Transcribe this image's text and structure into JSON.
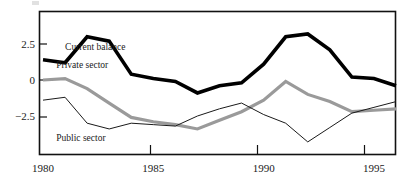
{
  "chart_data": {
    "type": "line",
    "title": "",
    "subtitle": "",
    "xlabel": "",
    "ylabel": "",
    "x": [
      1980,
      1981,
      1982,
      1983,
      1984,
      1985,
      1986,
      1987,
      1988,
      1989,
      1990,
      1991,
      1992,
      1993,
      1994,
      1995,
      1996
    ],
    "xlim": [
      1980,
      1996
    ],
    "ylim": [
      -5.0,
      4.1
    ],
    "x_tick_values": [
      1980,
      1985,
      1990,
      1995
    ],
    "x_tick_labels": [
      "1980",
      "1985",
      "1990",
      "1995"
    ],
    "y_tick_values": [
      2.5,
      0,
      -2.5
    ],
    "y_tick_labels": [
      "2.5",
      "0",
      "−2.5"
    ],
    "grid": false,
    "legend": "inline-annotations",
    "series": [
      {
        "name": "Current balance",
        "color": "#000000",
        "stroke_width": 3.6,
        "values": [
          1.4,
          1.2,
          3.0,
          2.7,
          0.4,
          0.1,
          -0.1,
          -0.9,
          -0.4,
          -0.2,
          1.1,
          3.0,
          3.2,
          2.1,
          0.2,
          0.1,
          -0.4
        ]
      },
      {
        "name": "Private sector",
        "color": "#9a9a9a",
        "stroke_width": 3.2,
        "values": [
          0.0,
          0.1,
          -0.6,
          -1.6,
          -2.6,
          -2.9,
          -3.1,
          -3.4,
          -2.8,
          -2.2,
          -1.4,
          -0.1,
          -1.0,
          -1.5,
          -2.2,
          -2.1,
          -2.0
        ]
      },
      {
        "name": "Public sector",
        "color": "#1a1a1a",
        "stroke_width": 1.0,
        "values": [
          -1.4,
          -1.2,
          -3.0,
          -3.4,
          -3.0,
          -3.1,
          -3.2,
          -2.5,
          -2.0,
          -1.6,
          -2.4,
          -3.0,
          -4.3,
          -3.3,
          -2.3,
          -1.9,
          -1.5
        ]
      }
    ],
    "annotations": [
      {
        "text": "Current balance",
        "x": 1981.0,
        "y": 2.05,
        "series": "Current balance"
      },
      {
        "text": "Private sector",
        "x": 1980.6,
        "y": 0.85,
        "series": "Private sector"
      },
      {
        "text": "Public sector",
        "x": 1980.6,
        "y": -4.25,
        "series": "Public sector"
      }
    ]
  },
  "axes": {
    "frame_color": "#111111",
    "background": "#ffffff"
  }
}
